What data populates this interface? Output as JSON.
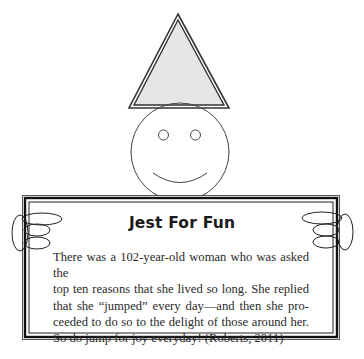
{
  "sign": {
    "title": "Jest For Fun",
    "body_lines": [
      "There was a 102-year-old woman who was asked the",
      "top ten reasons that she lived so long. She replied",
      "that she “jumped” every day—and then she pro-",
      "ceeded to do so to the delight of those around her.",
      "So do jump for joy everyday! (Roberts, 2011)"
    ]
  },
  "illustration": {
    "hat_fill": "#e6e6e6",
    "line_color": "#333333"
  }
}
